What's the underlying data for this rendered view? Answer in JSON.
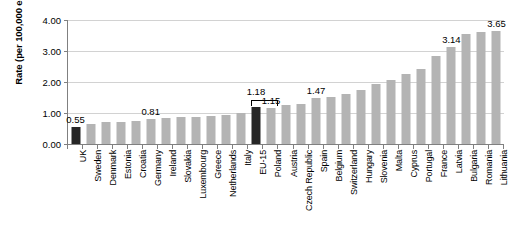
{
  "chart_data": {
    "type": "bar",
    "title": "",
    "subtitle": "",
    "xlabel": "",
    "ylabel": "Rate (per 100,000 employees)",
    "ylim": [
      0,
      4.0
    ],
    "ytick_labels": [
      "4.00",
      "3.00",
      "2.00",
      "1.00",
      "0.00"
    ],
    "ytick_values": [
      4.0,
      3.0,
      2.0,
      1.0,
      0.0
    ],
    "grid": true,
    "legend": "none",
    "categories": [
      "UK",
      "Sweden",
      "Denmark",
      "Estonia",
      "Croatia",
      "Germany",
      "Ireland",
      "Slovakia",
      "Luxembourg",
      "Greece",
      "Netherlands",
      "Italy",
      "EU-15",
      "Poland",
      "Austria",
      "Czech Republic",
      "Spain",
      "Belgium",
      "Switzerland",
      "Hungary",
      "Slovenia",
      "Malta",
      "Cyprus",
      "Portugal",
      "France",
      "Latvia",
      "Bulgaria",
      "Romania",
      "Lithuania"
    ],
    "values": [
      0.55,
      0.63,
      0.7,
      0.71,
      0.74,
      0.81,
      0.84,
      0.86,
      0.88,
      0.9,
      0.94,
      1.0,
      1.18,
      1.15,
      1.25,
      1.3,
      1.47,
      1.52,
      1.62,
      1.75,
      1.92,
      2.05,
      2.25,
      2.42,
      2.85,
      3.14,
      3.55,
      3.6,
      3.65
    ],
    "highlight_indices": [
      0,
      12
    ],
    "colors": {
      "bar": "#b4b4b4",
      "bar_highlight": "#262626",
      "axis": "#808080",
      "grid": "#d2d2d2",
      "text": "#000000",
      "background": "#ffffff"
    },
    "value_labels": [
      {
        "index": 0,
        "text": "0.55"
      },
      {
        "index": 5,
        "text": "0.81"
      },
      {
        "index": 13,
        "text": "1.15"
      },
      {
        "index": 12,
        "text": "1.18"
      },
      {
        "index": 16,
        "text": "1.47"
      },
      {
        "index": 25,
        "text": "3.14"
      },
      {
        "index": 28,
        "text": "3.65"
      }
    ],
    "bracket": {
      "from_index": 12,
      "to_index": 13,
      "label": "1.18"
    }
  }
}
